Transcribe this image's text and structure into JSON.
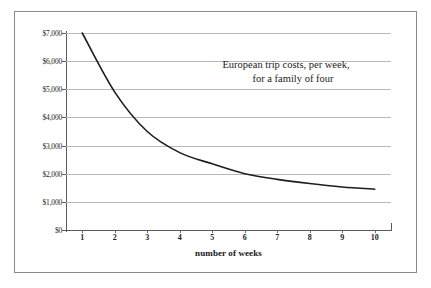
{
  "chart_data": {
    "type": "line",
    "title": "",
    "annotation_lines": [
      "European trip costs, per week,",
      "for a family of four"
    ],
    "xlabel": "number of weeks",
    "ylabel": "",
    "x": [
      1,
      2,
      3,
      4,
      5,
      6,
      7,
      8,
      9,
      10
    ],
    "categories": [
      "1",
      "2",
      "3",
      "4",
      "5",
      "6",
      "7",
      "8",
      "9",
      "10"
    ],
    "values": [
      7000,
      4900,
      3500,
      2750,
      2350,
      2000,
      1800,
      1650,
      1530,
      1450
    ],
    "series": [
      {
        "name": "European trip cost per week",
        "values": [
          7000,
          4900,
          3500,
          2750,
          2350,
          2000,
          1800,
          1650,
          1530,
          1450
        ]
      }
    ],
    "xlim": [
      0.5,
      10.5
    ],
    "ylim": [
      0,
      7000
    ],
    "ytick_values": [
      0,
      1000,
      2000,
      3000,
      4000,
      5000,
      6000,
      7000
    ],
    "ytick_labels": [
      "$0",
      "$1,000",
      "$2,000",
      "$3,000",
      "$4,000",
      "$5,000",
      "$6,000",
      "$7,000"
    ],
    "xtick_labels": [
      "1",
      "2",
      "3",
      "4",
      "5",
      "6",
      "7",
      "8",
      "9",
      "10"
    ],
    "grid": "horizontal",
    "legend": "none",
    "line_color": "#1d1d1d",
    "grid_color": "#b9b9b9",
    "axis_color": "#5a5a5a",
    "background_color": "#ffffff",
    "frame_color": "#8a8a8a"
  }
}
